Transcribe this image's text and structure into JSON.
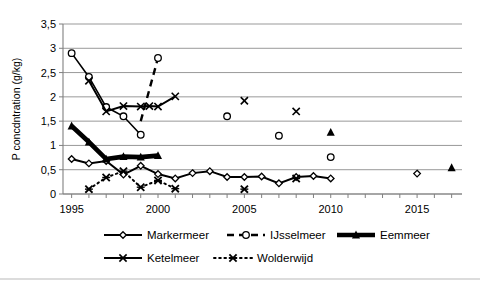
{
  "chart_data": {
    "type": "line",
    "title": "",
    "xlabel": "",
    "ylabel": "P concdntration (g/kg)",
    "xlim": [
      1994.5,
      2017.6
    ],
    "ylim": [
      0,
      3.5
    ],
    "grid": "horizontal",
    "legend_position": "bottom",
    "y_ticks": [
      "0",
      "0,5",
      "1",
      "1,5",
      "2",
      "2,5",
      "3",
      "3,5"
    ],
    "y_tick_values": [
      0,
      0.5,
      1,
      1.5,
      2,
      2.5,
      3,
      3.5
    ],
    "x_ticks": [
      "1995",
      "2000",
      "2005",
      "2010",
      "2015"
    ],
    "x_tick_values": [
      1995,
      2000,
      2005,
      2010,
      2015
    ],
    "x_minor_step": 1,
    "series": [
      {
        "name": "Markermeer",
        "marker": "open-diamond",
        "line": "solid",
        "x": [
          1995,
          1996,
          1997,
          1998,
          1999,
          2000,
          2001,
          2002,
          2003,
          2004,
          2005,
          2006,
          2007,
          2008,
          2009,
          2010
        ],
        "y": [
          0.72,
          0.63,
          0.68,
          0.4,
          0.58,
          0.41,
          0.32,
          0.43,
          0.47,
          0.35,
          0.35,
          0.36,
          0.22,
          0.35,
          0.37,
          0.32
        ],
        "extra_points": [
          {
            "x": 2015,
            "y": 0.42
          }
        ]
      },
      {
        "name": "IJsselmeer",
        "marker": "open-circle",
        "line": "dashed",
        "x": [
          1995,
          1996,
          1997,
          1998,
          1999,
          2000
        ],
        "y": [
          2.9,
          2.41,
          1.79,
          1.6,
          1.22,
          2.8
        ],
        "segments": [
          [
            1999,
            1.5,
            2000,
            2.8
          ]
        ],
        "extra_points": [
          {
            "x": 2004,
            "y": 1.6
          },
          {
            "x": 2007,
            "y": 1.2
          },
          {
            "x": 2010,
            "y": 0.76
          }
        ]
      },
      {
        "name": "Eemmeer",
        "marker": "filled-triangle",
        "line": "thick-solid",
        "x": [
          1995,
          1996,
          1997,
          1998,
          1999,
          2000
        ],
        "y": [
          1.4,
          1.07,
          0.72,
          0.77,
          0.76,
          0.79
        ],
        "extra_points": [
          {
            "x": 2010,
            "y": 1.27
          },
          {
            "x": 2017,
            "y": 0.54
          }
        ]
      },
      {
        "name": "Ketelmeer",
        "marker": "cross-x",
        "line": "solid",
        "x": [
          1996,
          1997,
          1998,
          1999,
          1999.5,
          2000,
          2001
        ],
        "y": [
          2.33,
          1.7,
          1.81,
          1.8,
          1.81,
          1.8,
          2.01
        ],
        "extra_points": [
          {
            "x": 2005,
            "y": 1.92
          },
          {
            "x": 2008,
            "y": 1.7
          }
        ]
      },
      {
        "name": "Wolderwijd",
        "marker": "star-x",
        "line": "dotted",
        "x": [
          1996,
          1997,
          1998,
          1999,
          2000,
          2001
        ],
        "y": [
          0.1,
          0.34,
          0.47,
          0.14,
          0.28,
          0.11
        ],
        "extra_points": [
          {
            "x": 2005,
            "y": 0.1
          },
          {
            "x": 2008,
            "y": 0.32
          }
        ]
      }
    ]
  },
  "legend": {
    "items": [
      {
        "label": "Markermeer",
        "key": "markermeer"
      },
      {
        "label": "IJsselmeer",
        "key": "ijsselmeer"
      },
      {
        "label": "Eemmeer",
        "key": "eemmeer"
      },
      {
        "label": "Ketelmeer",
        "key": "ketelmeer"
      },
      {
        "label": "Wolderwijd",
        "key": "wolderwijd"
      }
    ]
  },
  "colors": {
    "ink": "#000000",
    "grid": "#999999",
    "axis": "#808080",
    "background": "#ffffff"
  }
}
